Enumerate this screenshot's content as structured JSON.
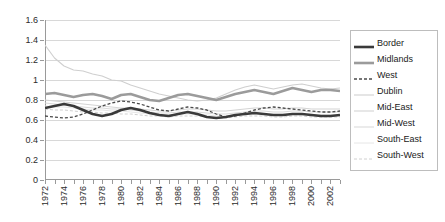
{
  "chart_data": {
    "type": "line",
    "title": "",
    "xlabel": "",
    "ylabel": "",
    "ylim": [
      0,
      1.6
    ],
    "ytick_labels": [
      "0",
      "0.2",
      "0.4",
      "0.6",
      "0.8",
      "1",
      "1.2",
      "1.4",
      "1.6"
    ],
    "ytick_values": [
      0,
      0.2,
      0.4,
      0.6,
      0.8,
      1,
      1.2,
      1.4,
      1.6
    ],
    "grid": true,
    "legend_position": "right",
    "x": [
      1972,
      1973,
      1974,
      1975,
      1976,
      1977,
      1978,
      1979,
      1980,
      1981,
      1982,
      1983,
      1984,
      1985,
      1986,
      1987,
      1988,
      1989,
      1990,
      1991,
      1992,
      1993,
      1994,
      1995,
      1996,
      1997,
      1998,
      1999,
      2000,
      2001,
      2002,
      2003
    ],
    "xtick_labels": [
      "1972",
      "",
      "1974",
      "",
      "1976",
      "",
      "1978",
      "",
      "1980",
      "",
      "1982",
      "",
      "1984",
      "",
      "1986",
      "",
      "1988",
      "",
      "1990",
      "",
      "1992",
      "",
      "1994",
      "",
      "1996",
      "",
      "1998",
      "",
      "2000",
      "",
      "2002",
      ""
    ],
    "series": [
      {
        "name": "Border",
        "style": "solid-thick-dark",
        "color": "#3a3a3a",
        "values": [
          0.72,
          0.74,
          0.76,
          0.74,
          0.7,
          0.66,
          0.64,
          0.66,
          0.7,
          0.72,
          0.7,
          0.67,
          0.65,
          0.64,
          0.66,
          0.68,
          0.66,
          0.63,
          0.62,
          0.63,
          0.65,
          0.66,
          0.67,
          0.66,
          0.65,
          0.65,
          0.66,
          0.66,
          0.65,
          0.64,
          0.64,
          0.65
        ]
      },
      {
        "name": "Midlands",
        "style": "solid-thick-gray",
        "color": "#9b9b9b",
        "values": [
          0.86,
          0.87,
          0.85,
          0.83,
          0.85,
          0.86,
          0.84,
          0.81,
          0.85,
          0.86,
          0.83,
          0.8,
          0.79,
          0.82,
          0.85,
          0.86,
          0.84,
          0.82,
          0.8,
          0.83,
          0.86,
          0.88,
          0.9,
          0.88,
          0.86,
          0.89,
          0.92,
          0.9,
          0.88,
          0.9,
          0.9,
          0.89
        ]
      },
      {
        "name": "West",
        "style": "dashed-dark",
        "color": "#4a4a4a",
        "values": [
          0.64,
          0.63,
          0.62,
          0.63,
          0.66,
          0.7,
          0.74,
          0.77,
          0.79,
          0.78,
          0.76,
          0.73,
          0.7,
          0.69,
          0.71,
          0.73,
          0.72,
          0.7,
          0.66,
          0.63,
          0.64,
          0.67,
          0.7,
          0.72,
          0.73,
          0.72,
          0.71,
          0.7,
          0.69,
          0.68,
          0.68,
          0.69
        ]
      },
      {
        "name": "Dublin",
        "style": "solid-thin-light",
        "color": "#cfcfcf",
        "values": [
          1.35,
          1.22,
          1.14,
          1.1,
          1.09,
          1.06,
          1.04,
          1.0,
          0.99,
          0.95,
          0.92,
          0.89,
          0.86,
          0.84,
          0.82,
          0.8,
          0.79,
          0.8,
          0.82,
          0.86,
          0.9,
          0.93,
          0.95,
          0.93,
          0.91,
          0.93,
          0.95,
          0.96,
          0.94,
          0.92,
          0.91,
          0.92
        ]
      },
      {
        "name": "Mid-East",
        "style": "solid-thin-light",
        "color": "#d4d4d4",
        "values": [
          0.8,
          0.79,
          0.78,
          0.77,
          0.76,
          0.75,
          0.74,
          0.73,
          0.72,
          0.72,
          0.71,
          0.7,
          0.69,
          0.69,
          0.7,
          0.71,
          0.71,
          0.7,
          0.69,
          0.69,
          0.7,
          0.71,
          0.72,
          0.72,
          0.71,
          0.71,
          0.72,
          0.72,
          0.71,
          0.71,
          0.71,
          0.71
        ]
      },
      {
        "name": "Mid-West",
        "style": "solid-thin-light",
        "color": "#dadada",
        "values": [
          0.77,
          0.76,
          0.75,
          0.74,
          0.73,
          0.72,
          0.72,
          0.71,
          0.71,
          0.7,
          0.69,
          0.68,
          0.67,
          0.67,
          0.68,
          0.68,
          0.68,
          0.67,
          0.66,
          0.66,
          0.67,
          0.68,
          0.69,
          0.69,
          0.68,
          0.68,
          0.69,
          0.69,
          0.68,
          0.68,
          0.68,
          0.68
        ]
      },
      {
        "name": "South-East",
        "style": "solid-thin-verylight",
        "color": "#e6e6e6",
        "values": [
          0.74,
          0.73,
          0.73,
          0.72,
          0.71,
          0.7,
          0.7,
          0.69,
          0.69,
          0.68,
          0.67,
          0.66,
          0.66,
          0.65,
          0.66,
          0.66,
          0.66,
          0.65,
          0.64,
          0.64,
          0.65,
          0.66,
          0.66,
          0.66,
          0.65,
          0.65,
          0.66,
          0.66,
          0.65,
          0.65,
          0.65,
          0.65
        ]
      },
      {
        "name": "South-West",
        "style": "dashed-light",
        "color": "#d0d0d0",
        "values": [
          0.71,
          0.7,
          0.7,
          0.69,
          0.68,
          0.68,
          0.67,
          0.67,
          0.66,
          0.66,
          0.65,
          0.64,
          0.64,
          0.63,
          0.64,
          0.64,
          0.64,
          0.63,
          0.62,
          0.62,
          0.63,
          0.64,
          0.64,
          0.64,
          0.63,
          0.63,
          0.64,
          0.64,
          0.63,
          0.63,
          0.63,
          0.63
        ]
      }
    ]
  },
  "legend": {
    "items": [
      {
        "label": "Border"
      },
      {
        "label": "Midlands"
      },
      {
        "label": "West"
      },
      {
        "label": "Dublin"
      },
      {
        "label": "Mid-East"
      },
      {
        "label": "Mid-West"
      },
      {
        "label": "South-East"
      },
      {
        "label": "South-West"
      }
    ]
  }
}
